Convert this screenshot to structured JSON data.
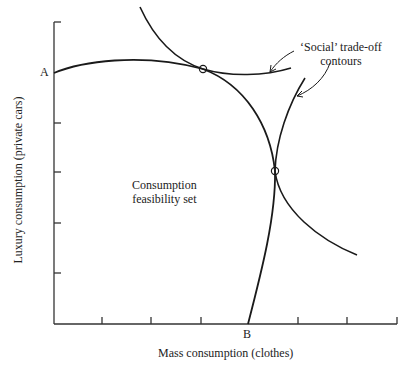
{
  "figure": {
    "type": "economics-diagram",
    "axes": {
      "x_label": "Mass consumption (clothes)",
      "y_label": "Luxury consumption (private cars)",
      "x_tick_count": 7,
      "y_tick_count": 5
    },
    "points": {
      "a_label": "A",
      "b_label": "B"
    },
    "region_label_line1": "Consumption",
    "region_label_line2": "feasibility set",
    "annotation_line1": "‘Social’ trade-off",
    "annotation_line2": "contours",
    "tangency_points": 2,
    "colors": {
      "line": "#1a1a1a",
      "axis": "#333333",
      "background": "#ffffff"
    }
  }
}
